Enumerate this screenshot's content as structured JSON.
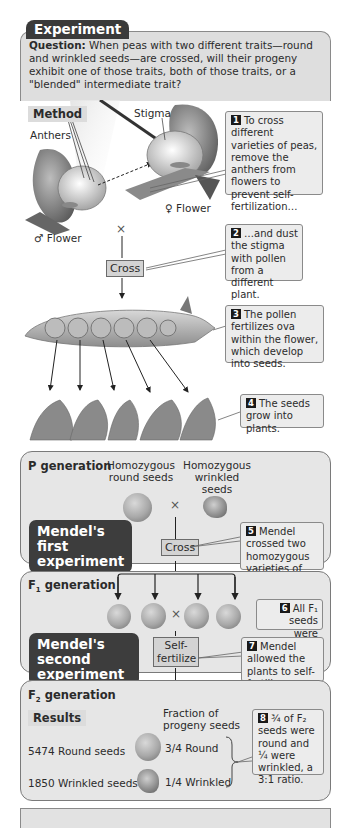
{
  "experiment": {
    "tab_label": "Experiment",
    "question_label": "Question:",
    "question_text": "When peas with two different traits—round and wrinkled seeds—are crossed, will their progeny exhibit one of those traits, both of those traits, or a \"blended\" intermediate trait?"
  },
  "method": {
    "label": "Method",
    "anthers_label": "Anthers",
    "stigma_label": "Stigma",
    "female_flower_label": "♀ Flower",
    "male_flower_label": "♂ Flower",
    "cross_symbol": "×",
    "cross_label": "Cross",
    "steps": [
      {
        "number": "1",
        "text": "To cross different varieties of peas, remove the anthers from flowers to prevent self-fertilization…"
      },
      {
        "number": "2",
        "text": "…and dust the stigma with pollen from a different plant."
      },
      {
        "number": "3",
        "text": "The pollen fertilizes ova within the flower, which develop into seeds."
      },
      {
        "number": "4",
        "text": "The seeds grow into plants."
      }
    ]
  },
  "p_generation": {
    "title": "P generation",
    "parent_left": "Homozygous round seeds",
    "parent_right": "Homozygous wrinkled seeds",
    "cross_symbol": "×",
    "badge": "Mendel's first experiment",
    "cross_label": "Cross",
    "step": {
      "number": "5",
      "text": "Mendel crossed two homozygous varieties of peas."
    }
  },
  "f1_generation": {
    "title_main": "F",
    "title_sub": "1",
    "title_rest": " generation",
    "cross_symbol": "×",
    "badge": "Mendel's second experiment",
    "self_fertilize_label": "Self-fertilize",
    "steps": [
      {
        "number": "6",
        "text": "All F₁ seeds were round."
      },
      {
        "number": "7",
        "text": "Mendel allowed the plants to self-fertilize."
      }
    ]
  },
  "f2_generation": {
    "title_main": "F",
    "title_sub": "2",
    "title_rest": " generation",
    "results_label": "Results",
    "fraction_header": "Fraction of progeny seeds",
    "rows": [
      {
        "count": "5474 Round seeds",
        "fraction": "3/4",
        "trait": "Round"
      },
      {
        "count": "1850 Wrinkled seeds",
        "fraction": "1/4",
        "trait": "Wrinkled"
      }
    ],
    "step": {
      "number": "8",
      "text": "¾ of F₂ seeds were round and ¼ were wrinkled, a 3:1 ratio."
    }
  }
}
